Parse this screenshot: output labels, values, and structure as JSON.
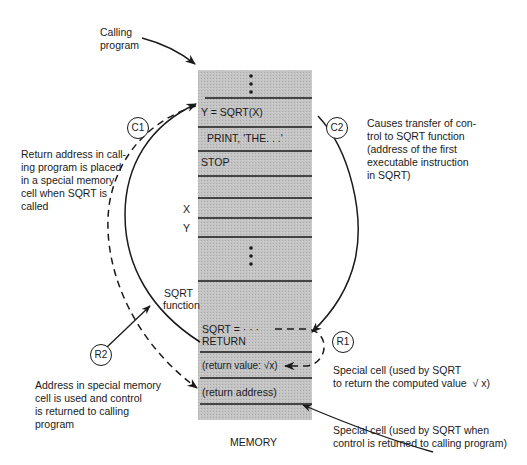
{
  "diagram": {
    "title_label": "MEMORY",
    "colors": {
      "memory_fill": "#bdbdbd",
      "ink": "#1a1a1a",
      "background": "#ffffff"
    },
    "calling_program_label": "Calling\nprogram",
    "sqrt_function_label": "SQRT\nfunction",
    "upper_block": {
      "cells": [
        {
          "text": "⋮",
          "kind": "ellipsis"
        },
        {
          "text": "Y  =  SQRT(X)"
        },
        {
          "text": "PRINT,  'THE. . .'"
        },
        {
          "text": "STOP"
        },
        {
          "text": ""
        },
        {
          "text": "",
          "side_label": "X"
        },
        {
          "text": "",
          "side_label": "Y"
        },
        {
          "text": "⋮",
          "kind": "ellipsis"
        }
      ]
    },
    "lower_block": {
      "cells": [
        {
          "text": "SQRT  =  · · ·",
          "line2": "RETURN"
        },
        {
          "text": "(return value: √x)"
        },
        {
          "text": "(return address)"
        }
      ]
    },
    "markers": [
      {
        "id": "C1",
        "label": "C1"
      },
      {
        "id": "C2",
        "label": "C2"
      },
      {
        "id": "R1",
        "label": "R1"
      },
      {
        "id": "R2",
        "label": "R2"
      }
    ],
    "annotations": {
      "c1": "Return address in call-\ning program is placed\nin a special memory\ncell when SQRT is\ncalled",
      "c2": "Causes transfer of con-\ntrol to SQRT function\n(address of the first\nexecutable instruction\nin SQRT)",
      "r1": "Special cell (used by SQRT\nto return the computed value  √ x)",
      "r2": "Address in special memory\ncell is used and control\nis returned to calling\nprogram",
      "return_cell": "Special cell (used by SQRT when\ncontrol is returned to calling program)"
    }
  }
}
